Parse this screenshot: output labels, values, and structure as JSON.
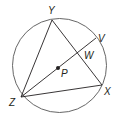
{
  "diagram": {
    "type": "circle-geometry",
    "circle": {
      "center_label": "P",
      "cx": 59.5,
      "cy": 65.5,
      "r": 47
    },
    "points": {
      "Y": {
        "label": "Y",
        "x": 52,
        "y": 20
      },
      "V": {
        "label": "V",
        "x": 96,
        "y": 38
      },
      "W": {
        "label": "W",
        "x": 79,
        "y": 51
      },
      "P": {
        "label": "P",
        "x": 58,
        "y": 68
      },
      "X": {
        "label": "X",
        "x": 102,
        "y": 85
      },
      "Z": {
        "label": "Z",
        "x": 21,
        "y": 97
      }
    },
    "segments": [
      "YZ",
      "YX",
      "ZX",
      "ZV"
    ],
    "stroke_color": "#231f20"
  }
}
